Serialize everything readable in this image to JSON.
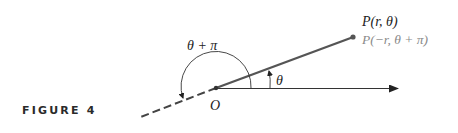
{
  "caption": "FIGURE 4",
  "labels": {
    "point_primary": "P(r, θ)",
    "point_secondary": "P(−r, θ + π)",
    "angle_large": "θ + π",
    "angle_small": "θ",
    "origin": "O"
  },
  "colors": {
    "ink": "#222222",
    "ray": "#555555",
    "secondary_label": "#8a8a8a"
  }
}
